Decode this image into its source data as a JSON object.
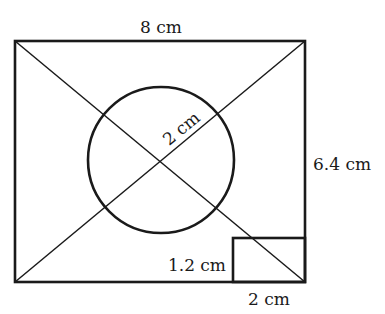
{
  "diagram": {
    "title": "",
    "shapes": {
      "outer_rectangle": {
        "width_label": "8 cm",
        "height_label": "6.4 cm"
      },
      "circle": {
        "radius_label": "2 cm"
      },
      "small_rectangle": {
        "width_label": "2 cm",
        "height_label": "1.2 cm"
      },
      "diagonals": 2
    },
    "labels": {
      "top": "8 cm",
      "right": "6.4 cm",
      "radius": "2 cm",
      "small_height": "1.2 cm",
      "small_width": "2 cm"
    },
    "colors": {
      "stroke": "#1a1a1a",
      "background": "#ffffff"
    }
  }
}
